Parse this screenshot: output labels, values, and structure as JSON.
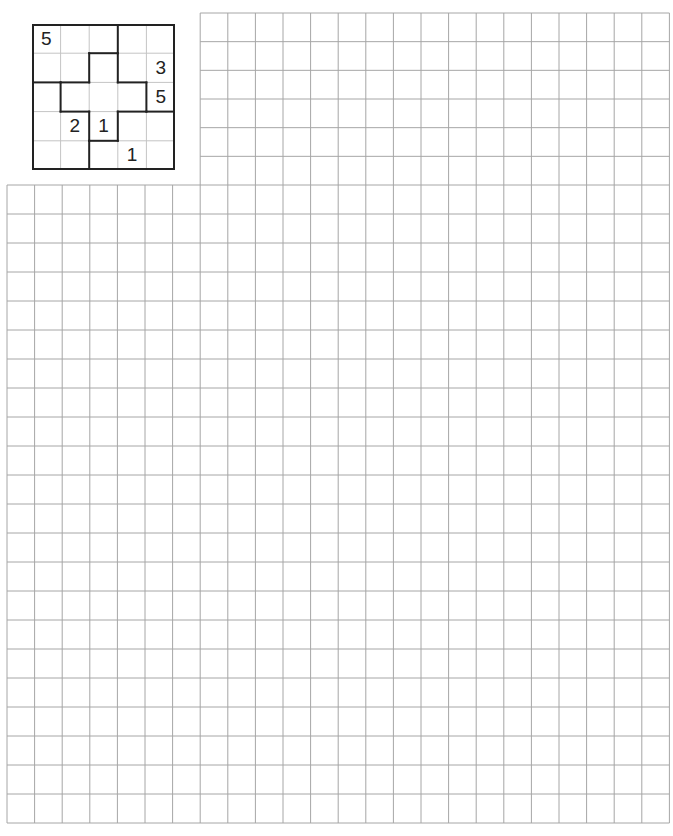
{
  "puzzle": {
    "size": 5,
    "givens": [
      {
        "row": 0,
        "col": 0,
        "value": "5"
      },
      {
        "row": 1,
        "col": 4,
        "value": "3"
      },
      {
        "row": 2,
        "col": 4,
        "value": "5"
      },
      {
        "row": 3,
        "col": 1,
        "value": "2"
      },
      {
        "row": 3,
        "col": 2,
        "value": "1"
      },
      {
        "row": 4,
        "col": 3,
        "value": "1"
      }
    ],
    "regions": [
      [
        "A",
        "A",
        "A",
        "B",
        "B"
      ],
      [
        "A",
        "A",
        "C",
        "B",
        "B"
      ],
      [
        "D",
        "C",
        "C",
        "C",
        "B"
      ],
      [
        "D",
        "D",
        "C",
        "E",
        "E"
      ],
      [
        "D",
        "D",
        "E",
        "E",
        "E"
      ]
    ]
  },
  "work_grid": {
    "upper": {
      "columns": 17,
      "rows": 6
    },
    "lower": {
      "columns": 24,
      "rows": 22
    },
    "line_color": "#a6a6a6"
  }
}
